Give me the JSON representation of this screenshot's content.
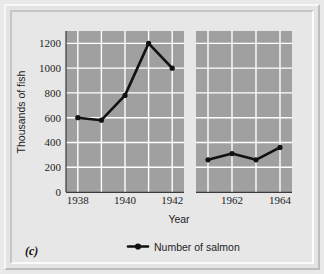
{
  "figure": {
    "panel_tag": "(c)",
    "background_color": "#e7e7e7",
    "frame_color": "#e9e9e9",
    "plot_background_color": "#a0a0a0",
    "gridline_color": "#ffffff",
    "series_color": "#111111"
  },
  "chart_data": {
    "type": "line",
    "title": "",
    "subtitle": "",
    "xlabel": "Year",
    "ylabel": "Thousands of fish",
    "ylim": [
      0,
      1300
    ],
    "yticks": [
      200,
      400,
      600,
      800,
      1000,
      1200
    ],
    "ytick_labels": [
      "200",
      "400",
      "600",
      "800",
      "1000",
      "1200"
    ],
    "zero_label": "0",
    "grid": true,
    "legend_position": "bottom-center",
    "axis_break": true,
    "panels": [
      {
        "name": "early-period",
        "xlim": [
          1937.5,
          1942.5
        ],
        "xticks": [
          1938,
          1940,
          1942
        ],
        "xtick_labels": [
          "1938",
          "1940",
          "1942"
        ],
        "x": [
          1938,
          1939,
          1940,
          1941,
          1942
        ],
        "y": [
          600,
          580,
          780,
          1200,
          1000
        ]
      },
      {
        "name": "late-period",
        "xlim": [
          1960.5,
          1964.5
        ],
        "xticks": [
          1962,
          1964
        ],
        "xtick_labels": [
          "1962",
          "1964"
        ],
        "x": [
          1961,
          1962,
          1963,
          1964
        ],
        "y": [
          260,
          310,
          260,
          360
        ]
      }
    ],
    "series": [
      {
        "name": "Number of salmon",
        "marker": "circle",
        "line_style": "solid"
      }
    ],
    "legend": [
      {
        "label": "Number of salmon",
        "marker": "line-with-dot"
      }
    ]
  }
}
